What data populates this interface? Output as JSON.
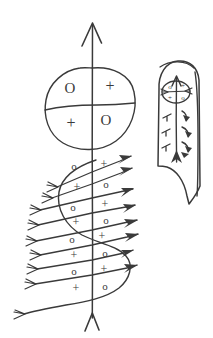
{
  "figure": {
    "ink_color": "#3a3a3a",
    "background_color": "#ffffff",
    "width": 213,
    "height": 338
  },
  "axis": {
    "name": "vertical-axis",
    "top_arrow": "up-arrow-open",
    "bottom_arrow": "down-fork-open",
    "x": 92,
    "y_top": 22,
    "y_bottom": 330
  },
  "top_circle": {
    "name": "quadrant-ellipse",
    "cx": 90,
    "cy": 106,
    "rx": 45,
    "ry": 37,
    "quadrants": [
      {
        "position": "top-left",
        "symbol": "O",
        "x": 70,
        "y": 90
      },
      {
        "position": "top-right",
        "symbol": "+",
        "x": 110,
        "y": 86
      },
      {
        "position": "bottom-left",
        "symbol": "+",
        "x": 71,
        "y": 124
      },
      {
        "position": "bottom-right",
        "symbol": "O",
        "x": 106,
        "y": 122
      }
    ]
  },
  "ladder": {
    "name": "symbol-ladder-grid",
    "left_x": 60,
    "right_x": 124,
    "divider_x": 92,
    "rows": [
      {
        "index": 0,
        "y": 166,
        "left_symbol": "o",
        "right_symbol": "+"
      },
      {
        "index": 1,
        "y": 186,
        "left_symbol": "+",
        "right_symbol": "o"
      },
      {
        "index": 2,
        "y": 206,
        "left_symbol": "o",
        "right_symbol": "+"
      },
      {
        "index": 3,
        "y": 222,
        "left_symbol": "+",
        "right_symbol": "o"
      },
      {
        "index": 4,
        "y": 239,
        "left_symbol": "o",
        "right_symbol": "+"
      },
      {
        "index": 5,
        "y": 255,
        "left_symbol": "+",
        "right_symbol": "o"
      },
      {
        "index": 6,
        "y": 271,
        "left_symbol": "o",
        "right_symbol": "+"
      },
      {
        "index": 7,
        "y": 287,
        "left_symbol": "+",
        "right_symbol": "o"
      }
    ],
    "arrow_lines": [
      {
        "index": 0,
        "label": "arrow-line-1",
        "y_left": 186,
        "y_right": 156
      },
      {
        "index": 1,
        "label": "arrow-line-2",
        "y_left": 197,
        "y_right": 168
      },
      {
        "index": 2,
        "label": "arrow-line-3",
        "y_left": 209,
        "y_right": 188
      },
      {
        "index": 3,
        "label": "arrow-line-4",
        "y_left": 224,
        "y_right": 205
      },
      {
        "index": 4,
        "label": "arrow-line-5",
        "y_left": 240,
        "y_right": 220
      },
      {
        "index": 5,
        "label": "arrow-line-6",
        "y_left": 254,
        "y_right": 234
      },
      {
        "index": 6,
        "label": "arrow-line-7",
        "y_left": 268,
        "y_right": 250
      },
      {
        "index": 7,
        "label": "arrow-line-8",
        "y_left": 283,
        "y_right": 265
      }
    ],
    "arrowhead_style": "solid-filled",
    "tail_style": "feather-barb"
  },
  "wave_curve": {
    "name": "s-shaped-wave-curve",
    "description": "sinusoidal curve weaving through the ladder, tail to lower-left",
    "tail_barb": true
  },
  "right_figure": {
    "name": "scroll-banner-shape",
    "description": "rounded-top banner / leaf shape with torn lower edge",
    "bounds": {
      "x": 155,
      "y": 60,
      "width": 48,
      "height": 145
    },
    "inner_circle": {
      "name": "mini-quadrant-circle",
      "cx": 176,
      "cy": 92,
      "rx": 14,
      "ry": 11,
      "quadrants": [
        {
          "position": "top-left",
          "symbol": "o",
          "x": 170,
          "y": 87
        },
        {
          "position": "top-right",
          "symbol": "+",
          "x": 182,
          "y": 86
        },
        {
          "position": "bottom-left",
          "symbol": "+",
          "x": 170,
          "y": 98
        },
        {
          "position": "bottom-right",
          "symbol": "o",
          "x": 182,
          "y": 98
        }
      ],
      "side_arrows": [
        "left-arrow",
        "right-arrow",
        "up-arrow"
      ]
    },
    "center_arrow": {
      "name": "inner-vertical-arrow",
      "x": 176,
      "y_top": 78,
      "y_bottom": 162,
      "head": "up-arrow-solid"
    },
    "side_barbs": [
      {
        "side": "left",
        "y": 118
      },
      {
        "side": "right",
        "y": 115
      },
      {
        "side": "left",
        "y": 132
      },
      {
        "side": "right",
        "y": 131
      },
      {
        "side": "left",
        "y": 147
      },
      {
        "side": "right",
        "y": 146
      },
      {
        "side": "right",
        "y": 154
      }
    ]
  }
}
